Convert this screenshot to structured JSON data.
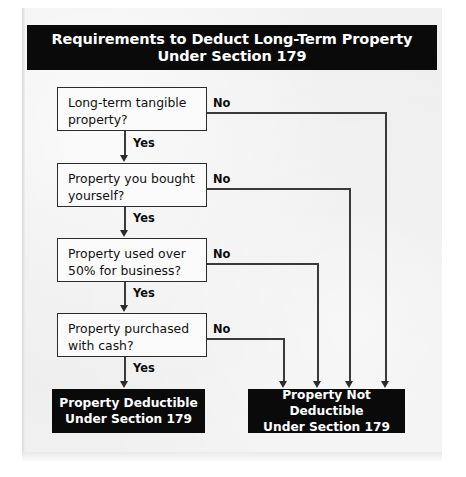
{
  "header": {
    "title_line1": "Requirements to Deduct Long-Term Property",
    "title_line2": "Under Section 179"
  },
  "flowchart": {
    "type": "decision-flowchart",
    "yes_label": "Yes",
    "no_label": "No",
    "decisions": [
      {
        "id": "d1",
        "line1": "Long-term tangible",
        "line2": "property?",
        "yes_target": "d2",
        "no_target": "not-deductible"
      },
      {
        "id": "d2",
        "line1": "Property you bought",
        "line2": "yourself?",
        "yes_target": "d3",
        "no_target": "not-deductible"
      },
      {
        "id": "d3",
        "line1": "Property used over",
        "line2": "50% for business?",
        "yes_target": "d4",
        "no_target": "not-deductible"
      },
      {
        "id": "d4",
        "line1": "Property purchased",
        "line2": "with cash?",
        "yes_target": "deductible",
        "no_target": "not-deductible"
      }
    ],
    "terminals": [
      {
        "id": "deductible",
        "line1": "Property Deductible",
        "line2": "Under Section 179"
      },
      {
        "id": "not-deductible",
        "line1": "Property Not Deductible",
        "line2": "Under Section 179"
      }
    ],
    "colors": {
      "terminal_fill": "#0a0a0a",
      "terminal_text": "#ffffff",
      "decision_fill": "#fbfbfb",
      "decision_border": "#2b2b2b",
      "line": "#3a3a3a",
      "page_background": "#efefef"
    }
  }
}
